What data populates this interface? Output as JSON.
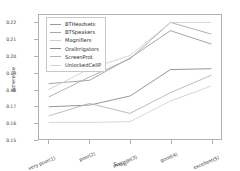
{
  "chart_data": {
    "type": "line",
    "title": "",
    "xlabel": "Score",
    "ylabel": "Adherence",
    "categories": [
      "very poor(1)",
      "poor(2)",
      "average(3)",
      "good(4)",
      "excellent(5)"
    ],
    "ylim": [
      0.15,
      0.225
    ],
    "yticks": [
      "0.15",
      "0.16",
      "0.17",
      "0.18",
      "0.19",
      "0.20",
      "0.21",
      "0.22"
    ],
    "ytick_values": [
      0.15,
      0.16,
      0.17,
      0.18,
      0.19,
      0.2,
      0.21,
      0.22
    ],
    "grid": false,
    "legend_position": "upper left",
    "series": [
      {
        "name": "BTHeadsets",
        "color": "#9b9b9b",
        "values": [
          0.1835,
          0.1855,
          0.199,
          0.2155,
          0.2075
        ]
      },
      {
        "name": "BTSpeakers",
        "color": "#a8a8a8",
        "values": [
          0.1755,
          0.1875,
          0.1985,
          0.2205,
          0.2135
        ]
      },
      {
        "name": "Magnifiers",
        "color": "#cfcfcf",
        "values": [
          0.18,
          0.1925,
          0.2005,
          0.2205,
          0.2205
        ]
      },
      {
        "name": "OralIrrigators",
        "color": "#8a8a8a",
        "values": [
          0.1695,
          0.1705,
          0.176,
          0.192,
          0.1925
        ]
      },
      {
        "name": "ScreenProt",
        "color": "#b4b4b4",
        "values": [
          0.164,
          0.1715,
          0.1655,
          0.178,
          0.1885
        ]
      },
      {
        "name": "UnlockedCellP",
        "color": "#d2d2d2",
        "values": [
          0.16,
          0.16,
          0.1605,
          0.173,
          0.182
        ]
      }
    ]
  },
  "axes": {
    "xlabel": "Score",
    "ylabel": "Adherence"
  },
  "legend": {
    "items": [
      {
        "label": "BTHeadsets"
      },
      {
        "label": "BTSpeakers"
      },
      {
        "label": "Magnifiers"
      },
      {
        "label": "OralIrrigators"
      },
      {
        "label": "ScreenProt"
      },
      {
        "label": "UnlockedCellP"
      }
    ]
  },
  "colors": {
    "axis": "#b0b0b0",
    "text": "#3d3d3d",
    "background": "#ffffff"
  }
}
